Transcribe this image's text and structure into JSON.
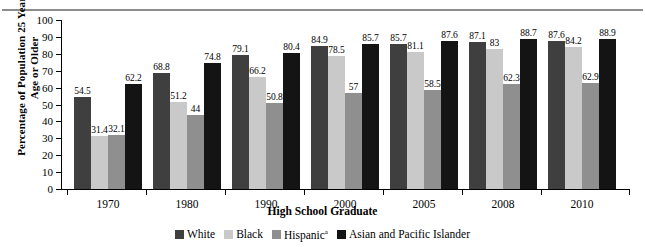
{
  "chart_data": {
    "type": "bar",
    "title": "",
    "xlabel": "High School Graduate",
    "ylabel": "Percentage of Population 25 Years of Age or Older",
    "ylim": [
      0,
      100
    ],
    "yticks": [
      0,
      10,
      20,
      30,
      40,
      50,
      60,
      70,
      80,
      90,
      100
    ],
    "grid": false,
    "legend_position": "bottom",
    "categories": [
      "1970",
      "1980",
      "1990",
      "2000",
      "2005",
      "2008",
      "2010"
    ],
    "series": [
      {
        "name": "White",
        "color": "#3f3f3f",
        "values": [
          54.5,
          68.8,
          79.1,
          84.9,
          85.7,
          87.1,
          87.6
        ]
      },
      {
        "name": "Black",
        "color": "#c9c9c9",
        "values": [
          31.4,
          51.2,
          66.2,
          78.5,
          81.1,
          83,
          84.2
        ]
      },
      {
        "name": "Hispanic",
        "color": "#8f8f8f",
        "values": [
          32.1,
          44,
          50.8,
          57,
          58.5,
          62.3,
          62.9
        ],
        "footnote": "a"
      },
      {
        "name": "Asian and Pacific Islander",
        "color": "#141414",
        "values": [
          62.2,
          74.8,
          80.4,
          85.7,
          87.6,
          88.7,
          88.9
        ]
      }
    ],
    "value_labels": {
      "1970": [
        "54.5",
        "31.4",
        "32.1",
        "62.2"
      ],
      "1980": [
        "68.8",
        "51.2",
        "44",
        "74.8"
      ],
      "1990": [
        "79.1",
        "66.2",
        "50.8",
        "80.4"
      ],
      "2000": [
        "84.9",
        "78.5",
        "57",
        "85.7"
      ],
      "2005": [
        "85.7",
        "81.1",
        "58.5",
        "87.6"
      ],
      "2008": [
        "87.1",
        "83",
        "62.3",
        "88.7"
      ],
      "2010": [
        "87.6",
        "84.2",
        "62.9",
        "88.9"
      ]
    }
  },
  "legend": {
    "items": [
      {
        "label": "White",
        "color": "#3f3f3f",
        "sup": ""
      },
      {
        "label": "Black",
        "color": "#c9c9c9",
        "sup": ""
      },
      {
        "label": "Hispanic",
        "color": "#8f8f8f",
        "sup": "a"
      },
      {
        "label": "Asian and Pacific Islander",
        "color": "#141414",
        "sup": ""
      }
    ]
  }
}
